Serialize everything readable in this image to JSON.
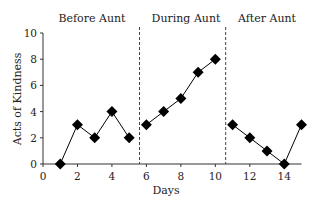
{
  "chart_data": {
    "type": "line",
    "title": "",
    "xlabel": "Days",
    "ylabel": "Acts of Kindness",
    "xlim": [
      0,
      15
    ],
    "ylim": [
      0,
      10
    ],
    "xticks": [
      0,
      2,
      4,
      6,
      8,
      10,
      12,
      14
    ],
    "yticks": [
      0,
      2,
      4,
      6,
      8,
      10
    ],
    "grid": false,
    "legend": null,
    "marker": "diamond",
    "color": "#000000",
    "phase_separators": [
      5.6,
      10.6
    ],
    "phases": [
      {
        "label": "Before Aunt",
        "x": [
          1,
          2,
          3,
          4,
          5
        ],
        "y": [
          0,
          3,
          2,
          4,
          2
        ]
      },
      {
        "label": "During Aunt",
        "x": [
          6,
          7,
          8,
          9,
          10
        ],
        "y": [
          3,
          4,
          5,
          7,
          8
        ]
      },
      {
        "label": "After Aunt",
        "x": [
          11,
          12,
          13,
          14,
          15
        ],
        "y": [
          3,
          2,
          1,
          0,
          3
        ]
      }
    ]
  },
  "labels": {
    "phase_before": "Before Aunt",
    "phase_during": "During Aunt",
    "phase_after": "After Aunt",
    "xlabel": "Days",
    "ylabel": "Acts of Kindness"
  }
}
